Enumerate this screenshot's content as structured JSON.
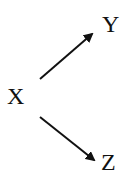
{
  "diagram": {
    "nodes": [
      {
        "id": "X",
        "label": "X"
      },
      {
        "id": "Y",
        "label": "Y"
      },
      {
        "id": "Z",
        "label": "Z"
      }
    ],
    "edges": [
      {
        "from": "X",
        "to": "Y"
      },
      {
        "from": "X",
        "to": "Z"
      }
    ],
    "colors": {
      "stroke": "#111111",
      "background": "#ffffff"
    }
  }
}
